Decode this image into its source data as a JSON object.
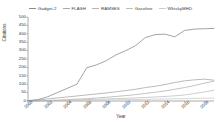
{
  "chart_data": {
    "type": "line",
    "title": "",
    "xlabel": "Year",
    "ylabel": "Citations",
    "xlim": [
      2000,
      2019
    ],
    "ylim": [
      0,
      500
    ],
    "grid": false,
    "legend_position": "top",
    "x": [
      2000,
      2001,
      2002,
      2003,
      2004,
      2005,
      2006,
      2007,
      2008,
      2009,
      2010,
      2011,
      2012,
      2013,
      2014,
      2015,
      2016,
      2017,
      2018,
      2019
    ],
    "xticks": [
      "2000",
      "2002",
      "2004",
      "2006",
      "2008",
      "2010",
      "2012",
      "2014",
      "2016",
      "2018"
    ],
    "xtick_values": [
      2000,
      2002,
      2004,
      2006,
      2008,
      2010,
      2012,
      2014,
      2016,
      2018
    ],
    "yticks": [
      "0",
      "50",
      "100",
      "150",
      "200",
      "250",
      "300",
      "350",
      "400",
      "450",
      "500"
    ],
    "ytick_values": [
      0,
      50,
      100,
      150,
      200,
      250,
      300,
      350,
      400,
      450,
      500
    ],
    "series": [
      {
        "name": "Gadget-2",
        "color": "#8c8c8c",
        "values": [
          2,
          8,
          25,
          50,
          75,
          100,
          198,
          215,
          240,
          275,
          300,
          330,
          378,
          395,
          398,
          382,
          420,
          428,
          430,
          432
        ]
      },
      {
        "name": "FLASH",
        "color": "#a8a8a8",
        "values": [
          2,
          5,
          12,
          18,
          24,
          30,
          36,
          42,
          48,
          55,
          62,
          70,
          80,
          88,
          98,
          110,
          120,
          126,
          130,
          124
        ]
      },
      {
        "name": "RAMSES",
        "color": "#b4b4b4",
        "values": [
          0,
          1,
          3,
          5,
          8,
          11,
          14,
          18,
          22,
          27,
          32,
          38,
          45,
          52,
          60,
          70,
          80,
          92,
          106,
          118
        ]
      },
      {
        "name": "Gasoline",
        "color": "#c0c0c0",
        "values": [
          0,
          1,
          2,
          3,
          5,
          6,
          8,
          10,
          12,
          14,
          16,
          18,
          21,
          24,
          27,
          31,
          36,
          44,
          54,
          64
        ]
      },
      {
        "name": "WhiskyMHD",
        "color": "#cccccc",
        "values": [
          0,
          0,
          1,
          1,
          2,
          3,
          4,
          5,
          6,
          7,
          8,
          9,
          10,
          11,
          12,
          13,
          14,
          15,
          16,
          17
        ]
      }
    ]
  },
  "legend": {
    "items": [
      {
        "label": "Gadget-2",
        "color": "#8c8c8c"
      },
      {
        "label": "FLASH",
        "color": "#a8a8a8"
      },
      {
        "label": "RAMSES",
        "color": "#b4b4b4"
      },
      {
        "label": "Gasoline",
        "color": "#c0c0c0"
      },
      {
        "label": "WhiskyMHD",
        "color": "#cccccc"
      }
    ]
  },
  "axes": {
    "x_title": "Year",
    "y_title": "Citations",
    "axis_color": "#555555"
  }
}
